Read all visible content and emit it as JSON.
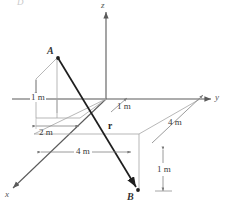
{
  "figure": {
    "title_mark": "D",
    "colors": {
      "axis": "#5a5a5a",
      "construction": "#9a9a9a",
      "vector": "#222222",
      "dimension": "#6b6b6b",
      "background": "#ffffff"
    }
  },
  "axes": [
    {
      "name": "z-axis",
      "label": "z",
      "direction": "up"
    },
    {
      "name": "y-axis",
      "label": "y",
      "direction": "right"
    },
    {
      "name": "x-axis",
      "label": "x",
      "direction": "down-left"
    }
  ],
  "points": [
    {
      "name": "point-a",
      "label": "A"
    },
    {
      "name": "point-b",
      "label": "B"
    }
  ],
  "vector": {
    "label": "r",
    "from": "A",
    "to": "B"
  },
  "dimensions": [
    {
      "id": "dim-a-height",
      "label": "1 m",
      "orientation": "vertical",
      "note": "height of A above xy-plane"
    },
    {
      "id": "dim-a-x",
      "label": "2 m",
      "orientation": "horizontal",
      "note": "x offset of A"
    },
    {
      "id": "dim-origin-y",
      "label": "1 m",
      "orientation": "leader",
      "note": "y offset near origin"
    },
    {
      "id": "dim-base-x",
      "label": "4 m",
      "orientation": "horizontal",
      "note": "base length along x"
    },
    {
      "id": "dim-base-y",
      "label": "4 m",
      "orientation": "diagonal",
      "note": "base length along y"
    },
    {
      "id": "dim-b-depth",
      "label": "1 m",
      "orientation": "vertical",
      "note": "depth of B below xy-plane"
    }
  ]
}
